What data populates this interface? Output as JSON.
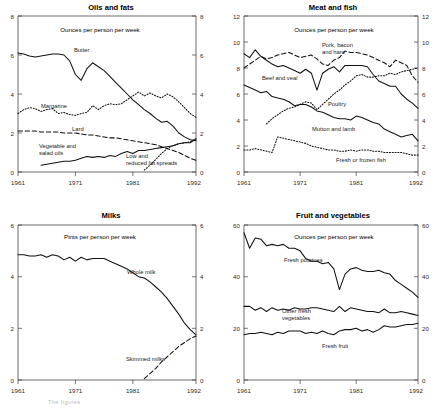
{
  "figure": {
    "caption_partial": "The figures",
    "x_ticks": [
      "1961",
      "1971",
      "1981",
      "1992"
    ],
    "x_tick_years": [
      1961,
      1971,
      1981,
      1992
    ],
    "x_range": [
      1961,
      1992
    ]
  },
  "panels": [
    {
      "id": "oils-and-fats",
      "title": "Oils and fats",
      "subtitle": "Ounces per person per week",
      "y_ticks": [
        "0",
        "2",
        "4",
        "6",
        "8"
      ]
    },
    {
      "id": "meat-and-fish",
      "title": "Meat and fish",
      "subtitle": "Ounces per person per week",
      "y_ticks": [
        "0",
        "2",
        "4",
        "6",
        "8",
        "10",
        "12"
      ]
    },
    {
      "id": "milks",
      "title": "Milks",
      "subtitle": "Pints per person per week",
      "y_ticks": [
        "0",
        "2",
        "4",
        "6"
      ]
    },
    {
      "id": "fruit-and-vegetables",
      "title": "Fruit and vegetables",
      "subtitle": "Ounces per person per week",
      "y_ticks": [
        "0",
        "20",
        "40",
        "60"
      ]
    }
  ],
  "chart_data": [
    {
      "type": "line",
      "id": "oils-and-fats",
      "title": "Oils and fats",
      "subtitle": "Ounces per person per week",
      "xlabel": "",
      "ylabel": "Ounces per person per week",
      "xlim": [
        1961,
        1992
      ],
      "ylim": [
        0,
        8
      ],
      "yticks": [
        0,
        2,
        4,
        6,
        8
      ],
      "xticks": [
        1961,
        1971,
        1981,
        1992
      ],
      "grid": false,
      "legend": "inline-annotations",
      "x": [
        1961,
        1962,
        1963,
        1964,
        1965,
        1966,
        1967,
        1968,
        1969,
        1970,
        1971,
        1972,
        1973,
        1974,
        1975,
        1976,
        1977,
        1978,
        1979,
        1980,
        1981,
        1982,
        1983,
        1984,
        1985,
        1986,
        1987,
        1988,
        1989,
        1990,
        1991,
        1992
      ],
      "series": [
        {
          "name": "Butter",
          "style": "solid",
          "label": "Butter",
          "values": [
            6.1,
            6.05,
            5.95,
            5.9,
            5.95,
            6.0,
            6.05,
            6.05,
            6.0,
            5.7,
            5.0,
            4.7,
            5.3,
            5.6,
            5.4,
            5.2,
            4.9,
            4.6,
            4.3,
            4.0,
            3.7,
            3.45,
            3.2,
            3.0,
            2.75,
            2.55,
            2.6,
            2.35,
            2.0,
            1.8,
            1.65,
            1.6
          ]
        },
        {
          "name": "Margarine",
          "style": "dotted",
          "label": "Margarine",
          "values": [
            3.0,
            3.2,
            3.3,
            3.25,
            3.1,
            3.2,
            3.25,
            3.0,
            3.05,
            2.95,
            2.9,
            3.0,
            3.05,
            3.4,
            3.2,
            3.4,
            3.5,
            3.45,
            3.5,
            3.7,
            3.9,
            4.1,
            3.9,
            4.05,
            3.9,
            3.8,
            4.0,
            3.85,
            3.6,
            3.3,
            3.0,
            2.8
          ]
        },
        {
          "name": "Lard",
          "style": "dashed",
          "label": "Lard",
          "values": [
            2.1,
            2.1,
            2.1,
            2.1,
            2.05,
            2.05,
            2.05,
            2.05,
            2.0,
            2.0,
            2.0,
            1.95,
            1.9,
            1.9,
            1.85,
            1.8,
            1.75,
            1.75,
            1.7,
            1.65,
            1.6,
            1.55,
            1.5,
            1.45,
            1.4,
            1.3,
            1.2,
            1.1,
            1.0,
            0.85,
            0.7,
            0.6
          ]
        },
        {
          "name": "Vegetable and salad oils",
          "style": "solid",
          "label": "Vegetable and salad oils",
          "values": [
            null,
            null,
            null,
            null,
            0.35,
            0.4,
            0.45,
            0.5,
            0.55,
            0.55,
            0.6,
            0.7,
            0.8,
            0.75,
            0.8,
            0.75,
            0.85,
            0.8,
            0.95,
            1.05,
            0.95,
            1.1,
            1.1,
            1.15,
            1.2,
            1.25,
            1.3,
            1.35,
            1.45,
            1.5,
            1.5,
            1.7
          ]
        },
        {
          "name": "Low and reduced fat spreads",
          "style": "dotted",
          "label": "Low and reduced fat spreads",
          "values": [
            null,
            null,
            null,
            null,
            null,
            null,
            null,
            null,
            null,
            null,
            null,
            null,
            null,
            null,
            null,
            null,
            null,
            null,
            null,
            null,
            null,
            null,
            0.1,
            0.35,
            0.65,
            0.95,
            1.2,
            1.35,
            1.45,
            1.5,
            1.55,
            1.7
          ]
        }
      ]
    },
    {
      "type": "line",
      "id": "meat-and-fish",
      "title": "Meat and fish",
      "subtitle": "Ounces per person per week",
      "xlabel": "",
      "ylabel": "Ounces per person per week",
      "xlim": [
        1961,
        1992
      ],
      "ylim": [
        0,
        12
      ],
      "yticks": [
        0,
        2,
        4,
        6,
        8,
        10,
        12
      ],
      "xticks": [
        1961,
        1971,
        1981,
        1992
      ],
      "grid": false,
      "legend": "inline-annotations",
      "x": [
        1961,
        1962,
        1963,
        1964,
        1965,
        1966,
        1967,
        1968,
        1969,
        1970,
        1971,
        1972,
        1973,
        1974,
        1975,
        1976,
        1977,
        1978,
        1979,
        1980,
        1981,
        1982,
        1983,
        1984,
        1985,
        1986,
        1987,
        1988,
        1989,
        1990,
        1991,
        1992
      ],
      "series": [
        {
          "name": "Pork, bacon and ham",
          "style": "dashed",
          "label": "Pork, bacon and ham",
          "values": [
            8.0,
            8.3,
            8.6,
            8.9,
            8.7,
            8.8,
            9.0,
            9.1,
            9.2,
            9.0,
            8.8,
            8.9,
            9.0,
            8.7,
            8.3,
            8.2,
            8.6,
            8.8,
            9.3,
            9.2,
            9.2,
            9.1,
            9.0,
            8.8,
            8.6,
            8.4,
            8.1,
            8.6,
            8.4,
            8.2,
            7.4,
            6.9
          ]
        },
        {
          "name": "Beef and veal",
          "style": "solid",
          "label": "Beef and veal",
          "values": [
            9.1,
            8.8,
            9.4,
            8.9,
            8.6,
            8.3,
            8.1,
            8.2,
            8.0,
            7.8,
            7.6,
            7.9,
            7.6,
            6.3,
            7.6,
            7.9,
            8.1,
            7.7,
            8.2,
            8.2,
            8.2,
            8.2,
            8.1,
            7.5,
            7.0,
            6.8,
            6.6,
            6.6,
            6.0,
            5.6,
            5.3,
            4.9
          ]
        },
        {
          "name": "Poultry",
          "style": "dotted",
          "label": "Poultry",
          "values": [
            null,
            null,
            null,
            null,
            3.7,
            4.1,
            4.4,
            4.7,
            4.9,
            5.0,
            5.2,
            5.4,
            5.3,
            4.8,
            5.2,
            5.6,
            6.0,
            6.3,
            6.7,
            7.0,
            7.4,
            7.5,
            7.3,
            7.3,
            7.4,
            7.4,
            7.6,
            7.5,
            7.7,
            7.8,
            7.9,
            8.0
          ]
        },
        {
          "name": "Mutton and lamb",
          "style": "solid",
          "label": "Mutton and lamb",
          "values": [
            6.7,
            6.5,
            6.3,
            6.1,
            6.2,
            5.8,
            5.7,
            5.6,
            5.4,
            5.1,
            5.2,
            5.2,
            5.0,
            4.7,
            4.6,
            4.4,
            4.2,
            4.1,
            4.1,
            4.0,
            4.3,
            4.2,
            4.0,
            3.8,
            3.7,
            3.3,
            3.1,
            2.9,
            2.7,
            2.8,
            2.9,
            2.4
          ]
        },
        {
          "name": "Fresh or frozen fish",
          "style": "dotted",
          "label": "Fresh or frozen fish",
          "values": [
            1.7,
            1.7,
            1.8,
            1.7,
            1.6,
            1.5,
            2.7,
            2.6,
            2.5,
            2.4,
            2.3,
            2.2,
            2.0,
            1.9,
            1.8,
            1.7,
            1.7,
            1.6,
            1.6,
            1.7,
            1.6,
            1.7,
            1.7,
            1.6,
            1.6,
            1.5,
            1.5,
            1.5,
            1.5,
            1.4,
            1.3,
            1.3
          ]
        }
      ]
    },
    {
      "type": "line",
      "id": "milks",
      "title": "Milks",
      "subtitle": "Pints per person per week",
      "xlabel": "",
      "ylabel": "Pints per person per week",
      "xlim": [
        1961,
        1992
      ],
      "ylim": [
        0,
        6
      ],
      "yticks": [
        0,
        2,
        4,
        6
      ],
      "xticks": [
        1961,
        1971,
        1981,
        1992
      ],
      "grid": false,
      "legend": "inline-annotations",
      "x": [
        1961,
        1962,
        1963,
        1964,
        1965,
        1966,
        1967,
        1968,
        1969,
        1970,
        1971,
        1972,
        1973,
        1974,
        1975,
        1976,
        1977,
        1978,
        1979,
        1980,
        1981,
        1982,
        1983,
        1984,
        1985,
        1986,
        1987,
        1988,
        1989,
        1990,
        1991,
        1992
      ],
      "series": [
        {
          "name": "Whole milk",
          "style": "solid",
          "label": "Whole milk",
          "values": [
            4.85,
            4.85,
            4.8,
            4.8,
            4.85,
            4.75,
            4.85,
            4.8,
            4.65,
            4.75,
            4.6,
            4.75,
            4.65,
            4.7,
            4.7,
            4.7,
            4.6,
            4.5,
            4.4,
            4.3,
            4.15,
            4.0,
            3.95,
            3.8,
            3.6,
            3.4,
            3.15,
            2.85,
            2.55,
            2.2,
            1.95,
            1.75
          ]
        },
        {
          "name": "Skimmed milks",
          "style": "dashed",
          "label": "Skimmed milks",
          "values": [
            null,
            null,
            null,
            null,
            null,
            null,
            null,
            null,
            null,
            null,
            null,
            null,
            null,
            null,
            null,
            null,
            null,
            null,
            null,
            null,
            null,
            null,
            0.05,
            0.25,
            0.45,
            0.7,
            0.9,
            1.1,
            1.3,
            1.45,
            1.6,
            1.7
          ]
        }
      ]
    },
    {
      "type": "line",
      "id": "fruit-and-vegetables",
      "title": "Fruit and vegetables",
      "subtitle": "Ounces per person per week",
      "xlabel": "",
      "ylabel": "Ounces per person per week",
      "xlim": [
        1961,
        1992
      ],
      "ylim": [
        0,
        60
      ],
      "yticks": [
        0,
        20,
        40,
        60
      ],
      "xticks": [
        1961,
        1971,
        1981,
        1992
      ],
      "grid": false,
      "legend": "inline-annotations",
      "x": [
        1961,
        1962,
        1963,
        1964,
        1965,
        1966,
        1967,
        1968,
        1969,
        1970,
        1971,
        1972,
        1973,
        1974,
        1975,
        1976,
        1977,
        1978,
        1979,
        1980,
        1981,
        1982,
        1983,
        1984,
        1985,
        1986,
        1987,
        1988,
        1989,
        1990,
        1991,
        1992
      ],
      "series": [
        {
          "name": "Fresh potatoes",
          "style": "solid",
          "label": "Fresh potatoes",
          "values": [
            57,
            51,
            55,
            54.5,
            52,
            52.5,
            52,
            52.5,
            51,
            51,
            50,
            47,
            46,
            46,
            45,
            45.5,
            43,
            35,
            41,
            43,
            43.5,
            42.5,
            42,
            42,
            42.5,
            41.5,
            41,
            38.5,
            37,
            35.5,
            34,
            32
          ]
        },
        {
          "name": "Other fresh vegetables",
          "style": "solid",
          "label": "Other fresh vegetables",
          "values": [
            28.5,
            28.5,
            27,
            28,
            26.5,
            28,
            27,
            27.5,
            27,
            28,
            27.5,
            27.5,
            28,
            28,
            27.5,
            27,
            26.5,
            28.5,
            26.5,
            28,
            27.5,
            27,
            26.5,
            26.5,
            26,
            27.5,
            26,
            26,
            26.5,
            26,
            25.5,
            25
          ]
        },
        {
          "name": "Fresh fruit",
          "style": "solid",
          "label": "Fresh fruit",
          "values": [
            17.5,
            18,
            18,
            18.5,
            18,
            17.5,
            18.5,
            18,
            19,
            19,
            19,
            18,
            18.5,
            18,
            19,
            18,
            17.5,
            19,
            19.5,
            19.5,
            20,
            19,
            19.5,
            18.5,
            19.5,
            21,
            20.5,
            20.5,
            21,
            21.5,
            21.5,
            22
          ]
        }
      ]
    }
  ]
}
